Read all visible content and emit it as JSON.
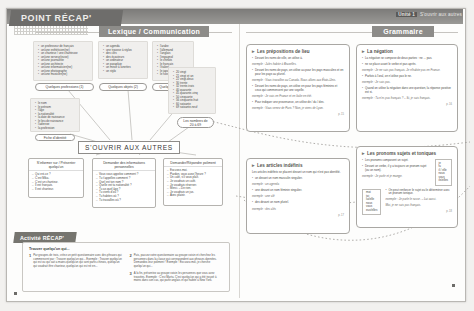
{
  "header": {
    "recap_tab": "POINT RÉCAP'",
    "unit_label": "Unité 1",
    "unit_title": "S'ouvrir aux autres",
    "left_banner": "Lexique / Communication",
    "right_banner": "Grammaire"
  },
  "mindmap": {
    "center": "S'OUVRIR AUX AUTRES",
    "vocab_groups": [
      {
        "tag": "Quelques professions (1)",
        "items": [
          "un professeur de français",
          "un/une esthéticien(ne)",
          "un chanteur / une chanteuse",
          "un/une serveur(euse)",
          "un/une journaliste",
          "un/une architecte",
          "un/une informaticien(ne)",
          "un/une photographe",
          "un/une musicien(ne)"
        ]
      },
      {
        "tag": "Quelques objets (2)",
        "items": [
          "un agenda",
          "une trousse à stylos",
          "des clés",
          "des écouteurs",
          "un ordinateur",
          "un parapluie",
          "un miroir à lunettes",
          "un stylo"
        ]
      },
      {
        "tag": "Quelques langues",
        "items": [
          "l'arabe",
          "l'allemand",
          "l'anglais",
          "l'espagnol",
          "le chinois",
          "le français",
          "l'italien",
          "le japonais",
          "le russe"
        ]
      },
      {
        "tag": "Fiche d'identité",
        "items": [
          "le nom",
          "le prénom",
          "l'âge",
          "la nationalité",
          "la date de naissance",
          "le lieu de naissance",
          "l'adresse",
          "la profession"
        ]
      },
      {
        "tag": "Les nombres de 20 à 69",
        "items": [
          "20 vingt",
          "21 vingt et un",
          "22 vingt-deux",
          "30 trente",
          "32 trente-trois",
          "40 quarante",
          "45 quarante-cinq",
          "50 cinquante",
          "56 cinquante-huit",
          "60 soixante",
          "69 soixante-neuf"
        ]
      }
    ],
    "comm_boxes": [
      {
        "title": "S'informer sur / Présenter quelqu'un",
        "items": [
          "Qui est-ce ?",
          "C'est Mika.",
          "C'est un chanteur.",
          "Il est français.",
          "Il est chanteur."
        ]
      },
      {
        "title": "Demander des informations personnelles",
        "items": [
          "Vous vous appelez comment ?",
          "Tu t'appelles comment ?",
          "Quel est ton nom ?",
          "Quelle est ta nationalité ?",
          "Tu as quel âge ?",
          "Tu viens d'où ?",
          "Tu habites où ?",
          "Tu travailles où ?"
        ]
      },
      {
        "title": "Demander/Répondre poliment",
        "items": [
          "Excusez-moi.",
          "Pardon, vous avez l'heure ?",
          "Un café, s'il vous plaît.",
          "Je voudrais un café.",
          "Je voudrais réserver.",
          "Merci. – De rien.",
          "Je voudrais un jus.",
          "Avec plaisir."
        ]
      }
    ]
  },
  "activity": {
    "tab": "Activité RÉCAP'",
    "title": "Trouver quelqu'un qui...",
    "steps": [
      {
        "num": "1",
        "text": "Par groupes de trois, créez un petit questionnaire avec des phrases qui commencent par : Trouver quelqu'un qui... Exemple : Trouver quelqu'un qui est ou qui sait a mains quelqu'un qui sont partis chinois, quelqu'un qui voudrait être chanteur, quelqu'un qui est né en..."
      },
      {
        "num": "2",
        "text": "Puis, passez votre questionnaire au groupe voisin et cherchez les personnes dans la classe qui correspondent aux phrases données. Demandez-leur poliment ! Exemple : Excusez-moi, je cherche quelqu'un qui..."
      },
      {
        "num": "3",
        "text": "À la fin, présentez au groupe voisin les personnes que vous avez trouvées. Exemple : C'est Marta. C'est quelqu'un qui a été trouvé à moins dans son cas, qui parle anglais et qui habite à New York."
      }
    ]
  },
  "grammar": {
    "boxes": [
      {
        "title": "Les prépositions de lieu",
        "paras": [
          "Devant les noms de ville, on utilise à.",
          "exemple : Jules habite à Bruxelles.",
          "Devant les noms de pays, on utilise au pour les pays masculins et en pour les pays au pluriel.",
          "exemple : Vous travaillez au Canada. Nous allons aux États-Unis.",
          "Devant les noms de pays, on utilise en pour les pays féminins et ceux qui commencent par une voyelle.",
          "exemple : Je vais en France et en Italie en été.",
          "Pour indiquer une provenance, on utilise de / du / des.",
          "exemple : Vous venez de Paris ? Non, je viens de Lyon."
        ],
        "ref": "p. 15"
      },
      {
        "title": "La négation",
        "paras": [
          "La négation se compose de deux parties : ne ... pas.",
          "ne se place avant le verbe et pas après.",
          "exemple : Je ne suis pas français. Je n'habite pas en France.",
          "Parfois à l'oral, on n'utilise pas le ne.",
          "exemple : Je sais pas.",
          "Quand on utilise la négation dans une question, la réponse positive est si.",
          "exemple : Tu n'es pas français ? – Si, je suis français."
        ],
        "ref": "p. 16"
      },
      {
        "title": "Les articles indéfinis",
        "paras": [
          "Les articles indéfinis se placent devant un nom qui n'est pas identifié.",
          "un devant un nom masculin singulier.",
          "exemple : un agenda",
          "une devant un nom féminin singulier.",
          "exemple : une clé",
          "des devant un nom pluriel.",
          "exemple : des clés"
        ],
        "ref": "p. 17"
      },
      {
        "title": "Les pronoms sujets et toniques",
        "paras": [
          "Les pronoms composent un sujet.",
          "Devant un verbe, il y a toujours un pronom sujet (ou un nom).",
          "exemple : Je parle et je mange.",
          "On peut renforcer le sujet ou le déterminer avec un pronom tonique.",
          "exemple : Je parle le russe. – Lui aussi.",
          "Moi, je ne suis pas français."
        ],
        "subject_pronouns": [
          "je",
          "tu",
          "il / elle",
          "nous",
          "vous",
          "ils/elles"
        ],
        "tonic_pronouns": [
          "moi",
          "toi",
          "lui/elle",
          "nous",
          "vous",
          "eux/elles"
        ],
        "ref": "p. 18"
      }
    ]
  },
  "folio": {
    "left": "34",
    "right": "35"
  }
}
